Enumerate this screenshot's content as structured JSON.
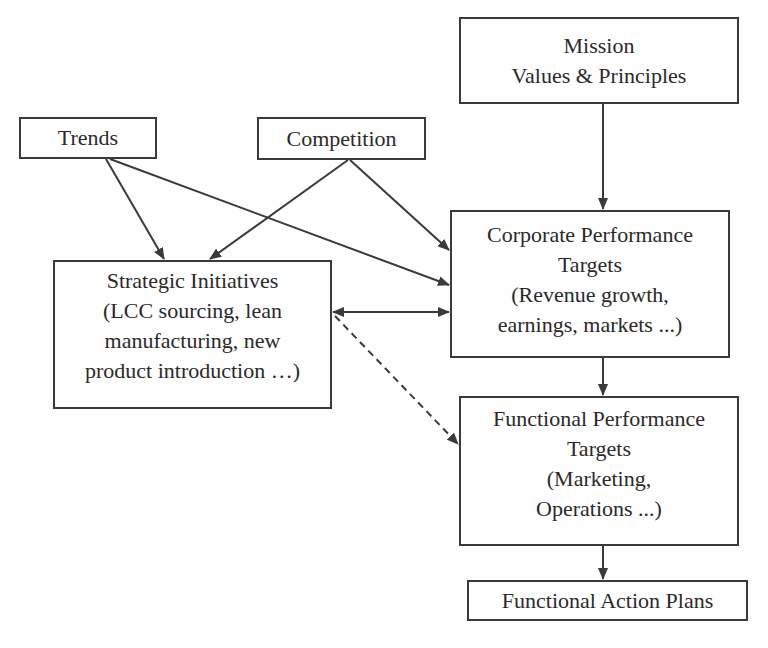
{
  "diagram": {
    "nodes": {
      "mission": {
        "lines": [
          "Mission",
          "Values & Principles"
        ]
      },
      "trends": {
        "lines": [
          "Trends"
        ]
      },
      "competition": {
        "lines": [
          "Competition"
        ]
      },
      "strategic": {
        "lines": [
          "Strategic Initiatives",
          "(LCC sourcing, lean",
          "manufacturing, new",
          "product introduction …)"
        ]
      },
      "corporate": {
        "lines": [
          "Corporate Performance",
          "Targets",
          "(Revenue growth,",
          "earnings, markets ...)"
        ]
      },
      "functional": {
        "lines": [
          "Functional Performance",
          "Targets",
          "(Marketing,",
          "Operations ...)"
        ]
      },
      "action": {
        "lines": [
          "Functional Action Plans"
        ]
      }
    },
    "edges": [
      {
        "from": "mission",
        "to": "corporate",
        "style": "solid"
      },
      {
        "from": "trends",
        "to": "strategic",
        "style": "solid"
      },
      {
        "from": "trends",
        "to": "corporate",
        "style": "solid"
      },
      {
        "from": "competition",
        "to": "strategic",
        "style": "solid"
      },
      {
        "from": "competition",
        "to": "corporate",
        "style": "solid"
      },
      {
        "from": "strategic",
        "to": "corporate",
        "style": "solid-bidirectional"
      },
      {
        "from": "strategic",
        "to": "functional",
        "style": "dashed"
      },
      {
        "from": "corporate",
        "to": "functional",
        "style": "solid"
      },
      {
        "from": "functional",
        "to": "action",
        "style": "solid"
      }
    ],
    "colors": {
      "stroke": "#3a3a3a",
      "text": "#2a2a2a",
      "background": "#fefefe"
    }
  }
}
